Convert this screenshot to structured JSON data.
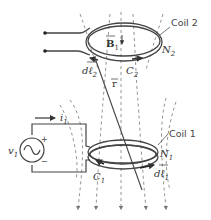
{
  "diagram": {
    "coil2": {
      "label": "Coil 2",
      "turns": "N",
      "turns_sub": "2",
      "contour": "C",
      "contour_sub": "2",
      "element": "dℓ",
      "element_sub": "2"
    },
    "coil1": {
      "label": "Coil 1",
      "turns": "N",
      "turns_sub": "1",
      "contour": "C",
      "contour_sub": "1",
      "element": "dℓ",
      "element_sub": "1"
    },
    "field": {
      "label": "B",
      "label_sub": "1"
    },
    "vector_r": {
      "label": "r"
    },
    "source": {
      "label": "v",
      "label_sub": "1",
      "plus": "+",
      "minus": "−"
    },
    "current": {
      "label": "i",
      "label_sub": "1"
    },
    "colors": {
      "line": "#444444",
      "dashed": "#777777",
      "background": "#ffffff"
    }
  }
}
